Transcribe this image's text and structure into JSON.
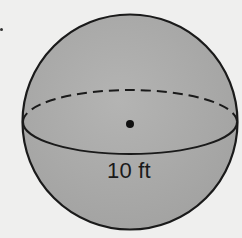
{
  "figure": {
    "type": "sphere",
    "dimension_label": "10 ft",
    "dimension_kind": "diameter",
    "colors": {
      "sphere_fill": "#a9a9a9",
      "outline": "#1a1a1a",
      "background": "#efefee"
    }
  }
}
